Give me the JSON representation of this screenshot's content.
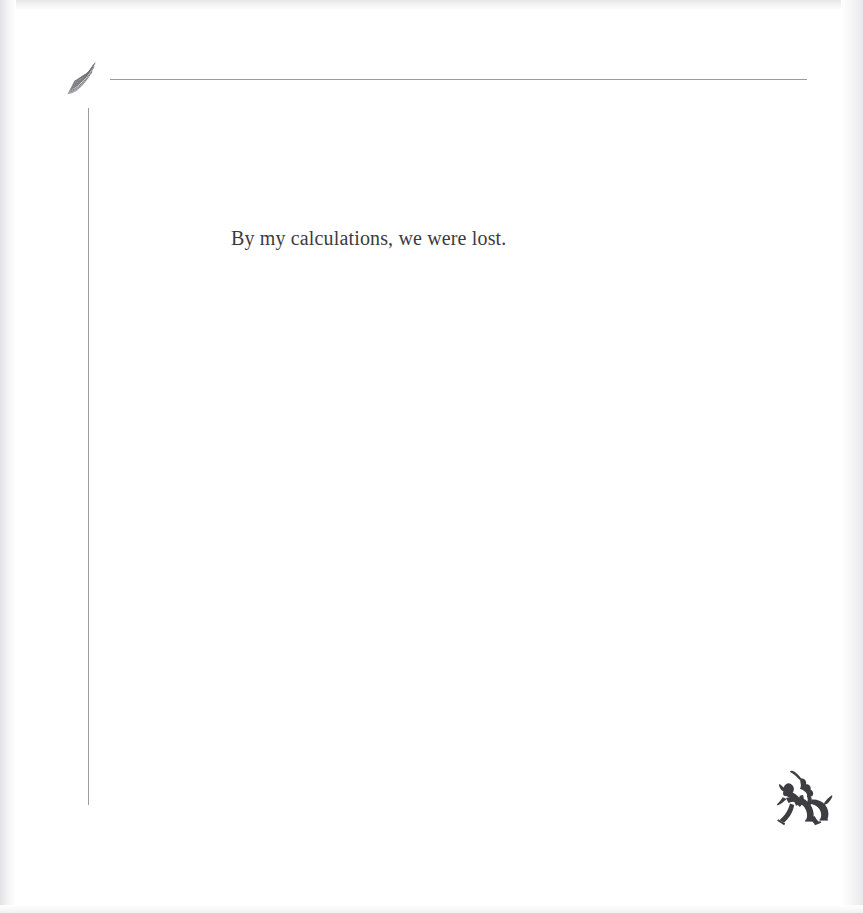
{
  "page": {
    "kind": "scanned-book-page",
    "background_color": "#ffffff",
    "width": 863,
    "height": 913
  },
  "ornament": {
    "name": "fan-flourish-ornament",
    "description": "small radiating fan of fine lines, tilted up to the right",
    "color": "#6e6e74"
  },
  "rules": {
    "horizontal": {
      "color": "#9b9ba0",
      "thickness": "1px"
    },
    "vertical": {
      "color": "#9b9ba0",
      "thickness": "1px"
    }
  },
  "body": {
    "text": "By my calculations, we were lost.",
    "color": "#3b3b40",
    "font_size": "20px"
  },
  "colophon": {
    "name": "bucking-horse-and-rider-colophon",
    "description": "silhouette of a rider with raised arm on a bucking horse",
    "color": "#3d3d42"
  }
}
